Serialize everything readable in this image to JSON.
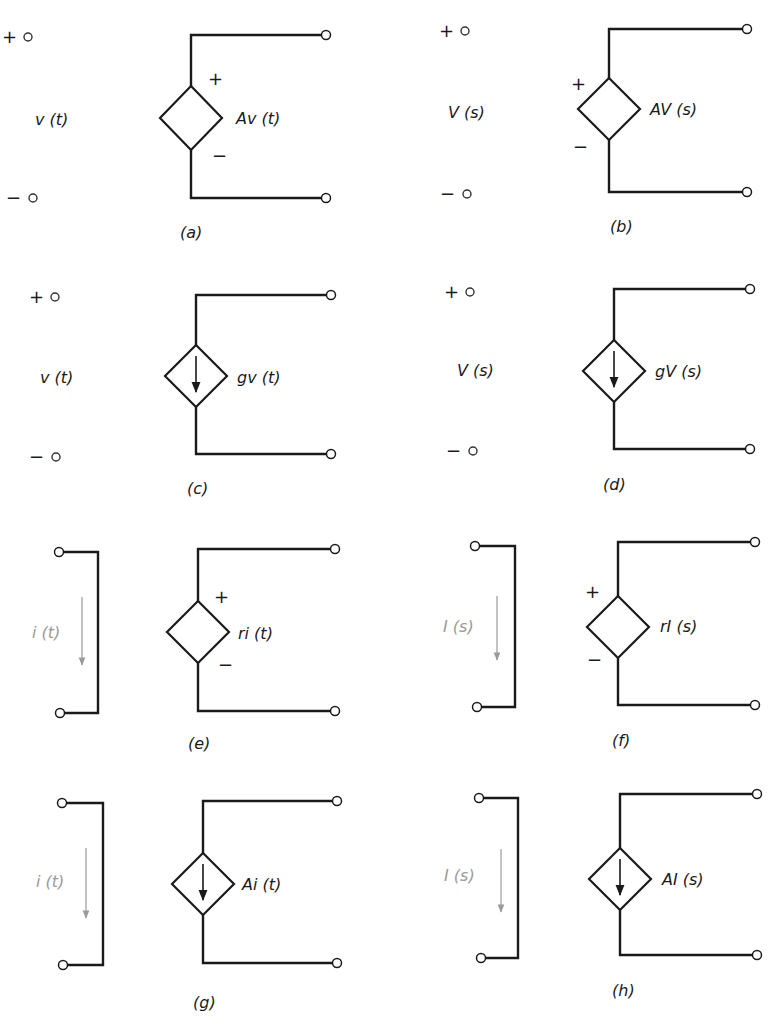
{
  "figure": {
    "colors": {
      "ink": "#1a1a1a",
      "faint": "#9a9a9a",
      "background": "#ffffff"
    },
    "panels": [
      {
        "id": "a",
        "caption": "(a)",
        "controlling": "voltage",
        "source": "voltage",
        "control_label": "v (t)",
        "source_label": "Av (t)",
        "plus_sign": "+",
        "minus_sign": "−",
        "in_plus": [
          28,
          37
        ],
        "in_minus": [
          33,
          198
        ],
        "ctrl_label_pos": [
          35,
          125
        ],
        "diamond": {
          "cx": 191,
          "cy": 118,
          "hw": 31,
          "hh": 32
        },
        "top_wire_y": 35,
        "bottom_wire_y": 198,
        "out_x": 326,
        "src_plus_pos": [
          208,
          85
        ],
        "src_minus_pos": [
          212,
          162
        ],
        "src_label_pos": [
          236,
          124
        ],
        "caption_pos": [
          180,
          238
        ]
      },
      {
        "id": "b",
        "caption": "(b)",
        "controlling": "voltage",
        "source": "voltage",
        "control_label": "V (s)",
        "source_label": "AV (s)",
        "plus_sign": "+",
        "minus_sign": "−",
        "in_plus": [
          465,
          31
        ],
        "in_minus": [
          467,
          194
        ],
        "ctrl_label_pos": [
          448,
          118
        ],
        "diamond": {
          "cx": 609,
          "cy": 109,
          "hw": 31,
          "hh": 31
        },
        "top_wire_y": 29,
        "bottom_wire_y": 192,
        "out_x": 747,
        "src_plus_pos": [
          571,
          90
        ],
        "src_minus_pos": [
          573,
          153
        ],
        "src_label_pos": [
          650,
          115
        ],
        "caption_pos": [
          610,
          232
        ]
      },
      {
        "id": "c",
        "caption": "(c)",
        "controlling": "voltage",
        "source": "current",
        "control_label": "v (t)",
        "source_label": "gv (t)",
        "plus_sign": "+",
        "minus_sign": "−",
        "in_plus": [
          55,
          297
        ],
        "in_minus": [
          56,
          457
        ],
        "ctrl_label_pos": [
          40,
          383
        ],
        "diamond": {
          "cx": 196,
          "cy": 376,
          "hw": 31,
          "hh": 31
        },
        "top_wire_y": 295,
        "bottom_wire_y": 454,
        "out_x": 331,
        "src_label_pos": [
          237,
          383
        ],
        "caption_pos": [
          187,
          494
        ]
      },
      {
        "id": "d",
        "caption": "(d)",
        "controlling": "voltage",
        "source": "current",
        "control_label": "V (s)",
        "source_label": "gV (s)",
        "plus_sign": "+",
        "minus_sign": "−",
        "in_plus": [
          470,
          292
        ],
        "in_minus": [
          473,
          451
        ],
        "ctrl_label_pos": [
          457,
          376
        ],
        "diamond": {
          "cx": 614,
          "cy": 371,
          "hw": 31,
          "hh": 31
        },
        "top_wire_y": 289,
        "bottom_wire_y": 449,
        "out_x": 750,
        "src_label_pos": [
          655,
          377
        ],
        "caption_pos": [
          603,
          490
        ]
      },
      {
        "id": "e",
        "caption": "(e)",
        "controlling": "current",
        "source": "voltage",
        "control_label": "i (t)",
        "source_label": "ri (t)",
        "plus_sign": "+",
        "minus_sign": "−",
        "in_top": [
          59,
          552
        ],
        "in_bottom": [
          60,
          713
        ],
        "bracket_x": 98,
        "ctrl_label_pos": [
          44,
          638
        ],
        "ctrl_arrow": {
          "x": 82,
          "y1": 597,
          "y2": 665
        },
        "diamond": {
          "cx": 198,
          "cy": 632,
          "hw": 31,
          "hh": 31
        },
        "top_wire_y": 549,
        "bottom_wire_y": 711,
        "out_x": 335,
        "src_plus_pos": [
          214,
          603
        ],
        "src_minus_pos": [
          218,
          671
        ],
        "src_label_pos": [
          238,
          639
        ],
        "caption_pos": [
          188,
          749
        ]
      },
      {
        "id": "f",
        "caption": "(f)",
        "controlling": "current",
        "source": "voltage",
        "control_label": "I (s)",
        "source_label": "rI (s)",
        "plus_sign": "+",
        "minus_sign": "−",
        "in_top": [
          475,
          546
        ],
        "in_bottom": [
          477,
          707
        ],
        "bracket_x": 515,
        "ctrl_label_pos": [
          455,
          632
        ],
        "ctrl_arrow": {
          "x": 497,
          "y1": 596,
          "y2": 660
        },
        "diamond": {
          "cx": 618,
          "cy": 627,
          "hw": 31,
          "hh": 31
        },
        "top_wire_y": 542,
        "bottom_wire_y": 705,
        "out_x": 755,
        "src_plus_pos": [
          585,
          598
        ],
        "src_minus_pos": [
          587,
          666
        ],
        "src_label_pos": [
          660,
          632
        ],
        "caption_pos": [
          612,
          746
        ]
      },
      {
        "id": "g",
        "caption": "(g)",
        "controlling": "current",
        "source": "current",
        "control_label": "i (t)",
        "source_label": "Ai (t)",
        "plus_sign": "+",
        "minus_sign": "−",
        "in_top": [
          62,
          803
        ],
        "in_bottom": [
          63,
          965
        ],
        "bracket_x": 103,
        "ctrl_label_pos": [
          48,
          887
        ],
        "ctrl_arrow": {
          "x": 86,
          "y1": 848,
          "y2": 918
        },
        "diamond": {
          "cx": 203,
          "cy": 884,
          "hw": 31,
          "hh": 31
        },
        "top_wire_y": 801,
        "bottom_wire_y": 963,
        "out_x": 337,
        "src_label_pos": [
          242,
          890
        ],
        "caption_pos": [
          193,
          1008
        ]
      },
      {
        "id": "h",
        "caption": "(h)",
        "controlling": "current",
        "source": "current",
        "control_label": "I (s)",
        "source_label": "AI (s)",
        "plus_sign": "+",
        "minus_sign": "−",
        "in_top": [
          479,
          798
        ],
        "in_bottom": [
          481,
          958
        ],
        "bracket_x": 518,
        "ctrl_label_pos": [
          456,
          881
        ],
        "ctrl_arrow": {
          "x": 501,
          "y1": 849,
          "y2": 912
        },
        "diamond": {
          "cx": 620,
          "cy": 879,
          "hw": 31,
          "hh": 31
        },
        "top_wire_y": 794,
        "bottom_wire_y": 955,
        "out_x": 757,
        "src_label_pos": [
          662,
          885
        ],
        "caption_pos": [
          612,
          996
        ]
      }
    ]
  }
}
